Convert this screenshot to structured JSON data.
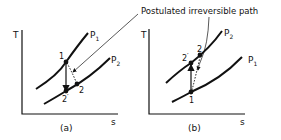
{
  "annotation": "Postulated irreversible path",
  "panel_a": {
    "caption": "(a)",
    "y_axis": "T",
    "x_axis": "s",
    "curve_upper": "P",
    "curve_upper_sub": "1",
    "curve_lower": "P",
    "curve_lower_sub": "2",
    "point_1": "1",
    "point_2": "2",
    "point_2s": "2",
    "prime": "′"
  },
  "panel_b": {
    "caption": "(b)",
    "y_axis": "T",
    "x_axis": "s",
    "curve_upper": "P",
    "curve_upper_sub": "2",
    "curve_lower": "P",
    "curve_lower_sub": "1",
    "point_1": "1",
    "point_2": "2",
    "point_2s": "2",
    "prime": "′"
  }
}
